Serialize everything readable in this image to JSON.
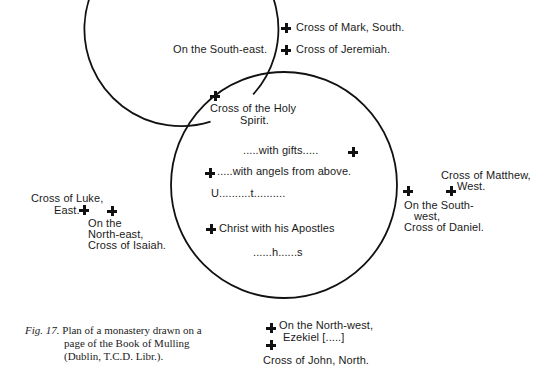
{
  "diagram": {
    "type": "monastery-plan",
    "circles": {
      "outer": {
        "cx": 284,
        "cy": 185,
        "r": 113
      },
      "inner": {
        "cx": 283,
        "cy": 186,
        "r": 97
      }
    },
    "labels": {
      "mark": "Cross of Mark, South.",
      "south_east": "On the South-east.",
      "jeremiah": "Cross of Jeremiah.",
      "holy_spirit_1": "Cross of the Holy",
      "holy_spirit_2": "Spirit.",
      "with_gifts": ".....with gifts.....",
      "with_angels": ".....with angels from above.",
      "u_t": "U..........t..........",
      "christ": "Christ with his Apostles",
      "h_s": "......h......s",
      "matthew_1": "Cross of Matthew,",
      "matthew_2": "West.",
      "south_west_1": "On the South-",
      "south_west_2": "west,",
      "daniel": "Cross of Daniel.",
      "luke_1": "Cross of Luke,",
      "luke_2": "East.",
      "north_east_1": "On the",
      "north_east_2": "North-east,",
      "isaiah": "Cross of Isaiah.",
      "north_west_1": "On the North-west,",
      "north_west_2": "Ezekiel [.....]",
      "john": "Cross of John, North."
    },
    "caption": {
      "fig": "Fig",
      "number": ". 17.",
      "line1": "Plan of a monastery drawn on a",
      "line2": "page of the Book of Mulling",
      "line3": "(Dublin, T.C.D. Libr.)."
    }
  }
}
